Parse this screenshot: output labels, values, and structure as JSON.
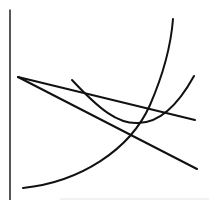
{
  "diagram": {
    "type": "line-sketch",
    "background": "#ffffff",
    "stroke_color": "#111111",
    "axis": {
      "name": "vertical-axis",
      "x": 10,
      "y1": 10,
      "y2": 200,
      "width": 1.4
    },
    "bottom_edge": {
      "name": "faint-bottom-edge",
      "x1": 60,
      "x2": 209,
      "y": 199,
      "color": "#e4e4e4",
      "width": 1
    },
    "elements": [
      {
        "name": "flat-downward-line",
        "kind": "line",
        "path": "M18 77 L195 120",
        "width": 2
      },
      {
        "name": "steep-downward-line",
        "kind": "line",
        "path": "M18 77 L197 169",
        "width": 2
      },
      {
        "name": "exponential-rising-curve",
        "kind": "curve",
        "path": "M23 188 C 80 182, 130 150, 150 105 C 163 75, 171 45, 173 19",
        "width": 2
      },
      {
        "name": "u-shaped-curve",
        "kind": "curve",
        "path": "M72 80 C 100 110, 118 124, 138 123 C 160 123, 178 105, 194 76",
        "width": 2
      }
    ]
  }
}
